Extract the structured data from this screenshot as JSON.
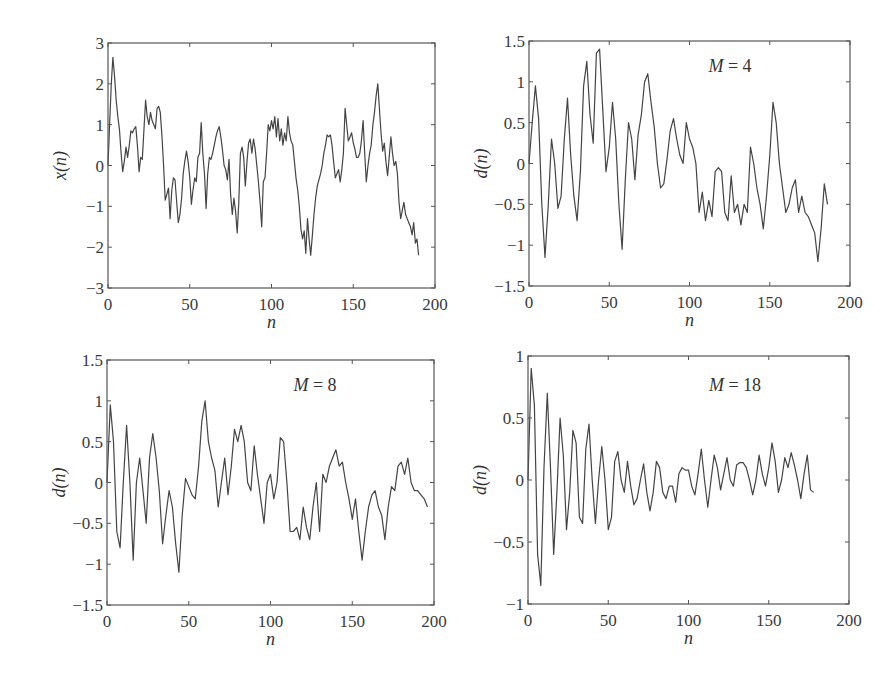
{
  "chart_data": [
    {
      "type": "line",
      "panel": "top-left",
      "title": "",
      "annotation": "",
      "xlabel": "n",
      "ylabel": "x(n)",
      "xlim": [
        0,
        200
      ],
      "ylim": [
        -3,
        3
      ],
      "xticks": [
        "0",
        "50",
        "100",
        "150",
        "200"
      ],
      "yticks": [
        "3",
        "2",
        "1",
        "0",
        "−1",
        "−2",
        "−3"
      ],
      "grid": false,
      "series": [
        {
          "name": "x(n)",
          "x": [
            0,
            1,
            2,
            3,
            4,
            5,
            6,
            7,
            8,
            9,
            10,
            11,
            12,
            13,
            14,
            15,
            16,
            17,
            18,
            19,
            20,
            21,
            22,
            23,
            24,
            25,
            26,
            27,
            28,
            29,
            30,
            31,
            32,
            33,
            34,
            35,
            36,
            37,
            38,
            39,
            40,
            41,
            42,
            43,
            44,
            45,
            46,
            47,
            48,
            49,
            50,
            51,
            52,
            53,
            54,
            55,
            56,
            57,
            58,
            59,
            60,
            61,
            62,
            63,
            64,
            65,
            66,
            67,
            68,
            69,
            70,
            71,
            72,
            73,
            74,
            75,
            76,
            77,
            78,
            79,
            80,
            81,
            82,
            83,
            84,
            85,
            86,
            87,
            88,
            89,
            90,
            91,
            92,
            93,
            94,
            95,
            96,
            97,
            98,
            99,
            100,
            101,
            102,
            103,
            104,
            105,
            106,
            107,
            108,
            109,
            110,
            111,
            112,
            113,
            114,
            115,
            116,
            117,
            118,
            119,
            120,
            121,
            122,
            123,
            124,
            125,
            126,
            127,
            128,
            129,
            130,
            131,
            132,
            133,
            134,
            135,
            136,
            137,
            138,
            139,
            140,
            141,
            142,
            143,
            144,
            145,
            146,
            147,
            148,
            149,
            150,
            151,
            152,
            153,
            154,
            155,
            156,
            157,
            158,
            159,
            160,
            161,
            162,
            163,
            164,
            165,
            166,
            167,
            168,
            169,
            170,
            171,
            172,
            173,
            174,
            175,
            176,
            177,
            178,
            179,
            180,
            181,
            182,
            183,
            184,
            185,
            186,
            187,
            188,
            189,
            190,
            191,
            192,
            193,
            194,
            195,
            196,
            197,
            198,
            199,
            200
          ],
          "values": [
            0,
            1.0,
            2.0,
            2.65,
            2.2,
            1.6,
            1.2,
            0.9,
            0.3,
            -0.15,
            0.1,
            0.45,
            0.2,
            0.5,
            0.85,
            0.8,
            0.9,
            0.95,
            0.5,
            -0.15,
            0.2,
            0.15,
            0.9,
            1.6,
            1.2,
            1.0,
            1.3,
            1.1,
            1.0,
            0.9,
            1.4,
            1.45,
            1.3,
            0.7,
            0.0,
            -0.85,
            -0.7,
            -0.55,
            -1.3,
            -0.6,
            -0.3,
            -0.35,
            -0.9,
            -1.4,
            -1.2,
            -0.8,
            -0.2,
            0.1,
            0.35,
            0.1,
            -0.3,
            -0.95,
            -0.6,
            -0.3,
            -0.4,
            0.2,
            0.3,
            1.05,
            0.3,
            -0.2,
            -1.05,
            -0.2,
            0.2,
            0.15,
            0.3,
            0.5,
            0.7,
            0.85,
            0.95,
            0.7,
            0.4,
            0.0,
            -0.1,
            -0.35,
            0.15,
            -0.7,
            -1.2,
            -0.8,
            -1.1,
            -1.65,
            -0.9,
            0.3,
            0.45,
            0.2,
            -0.5,
            0.1,
            0.55,
            0.65,
            0.3,
            0.65,
            0.4,
            0.0,
            -0.4,
            -0.9,
            -1.5,
            -0.4,
            -0.3,
            0.3,
            1.0,
            0.85,
            1.1,
            0.9,
            1.2,
            0.7,
            1.15,
            0.6,
            0.9,
            0.5,
            0.8,
            0.6,
            1.2,
            0.8,
            0.6,
            0.5,
            0.1,
            -0.3,
            -0.6,
            -1.0,
            -1.55,
            -1.8,
            -1.6,
            -2.15,
            -1.3,
            -1.8,
            -2.2,
            -1.7,
            -1.2,
            -0.8,
            -0.5,
            -0.35,
            -0.2,
            0.0,
            0.3,
            0.5,
            0.75,
            0.7,
            0.75,
            0.5,
            0.1,
            -0.3,
            -0.2,
            -0.1,
            -0.4,
            -0.1,
            0.3,
            1.4,
            1.0,
            0.6,
            0.7,
            0.8,
            0.55,
            0.4,
            0.2,
            0.2,
            0.3,
            0.6,
            1.1,
            0.3,
            -0.4,
            0.0,
            0.3,
            0.5,
            1.0,
            1.3,
            1.7,
            2.0,
            1.4,
            0.8,
            0.35,
            0.55,
            0.1,
            -0.25,
            0.2,
            0.7,
            0.3,
            0.0,
            0.1,
            -0.2,
            -0.9,
            -1.3,
            -1.1,
            -0.9,
            -1.2,
            -1.3,
            -1.4,
            -1.5,
            -1.7,
            -1.4,
            -1.9,
            -1.8,
            -2.2
          ]
        }
      ]
    },
    {
      "type": "line",
      "panel": "top-right",
      "annotation": "M = 4",
      "xlabel": "n",
      "ylabel": "d(n)",
      "xlim": [
        0,
        200
      ],
      "ylim": [
        -1.5,
        1.5
      ],
      "xticks": [
        "0",
        "50",
        "100",
        "150",
        "200"
      ],
      "yticks": [
        "1.5",
        "1",
        "0.5",
        "0",
        "−0.5",
        "−1",
        "−1.5"
      ],
      "grid": false,
      "series": [
        {
          "name": "d(n), M=4",
          "x": [
            0,
            2,
            4,
            6,
            8,
            10,
            12,
            14,
            16,
            18,
            20,
            22,
            24,
            26,
            28,
            30,
            32,
            34,
            36,
            38,
            40,
            42,
            44,
            46,
            48,
            50,
            52,
            54,
            56,
            58,
            60,
            62,
            64,
            66,
            68,
            70,
            72,
            74,
            76,
            78,
            80,
            82,
            84,
            86,
            88,
            90,
            92,
            94,
            96,
            98,
            100,
            102,
            104,
            106,
            108,
            110,
            112,
            114,
            116,
            118,
            120,
            122,
            124,
            126,
            128,
            130,
            132,
            134,
            136,
            138,
            140,
            142,
            144,
            146,
            148,
            150,
            152,
            154,
            156,
            158,
            160,
            162,
            164,
            166,
            168,
            170,
            172,
            174,
            176,
            178,
            180,
            182,
            184,
            186,
            188,
            190,
            192,
            194,
            196,
            198,
            200
          ],
          "values": [
            0,
            0.5,
            0.95,
            0.55,
            -0.5,
            -1.15,
            -0.5,
            0.3,
            0.0,
            -0.55,
            -0.4,
            0.3,
            0.8,
            0.1,
            -0.4,
            -0.7,
            -0.1,
            0.95,
            1.25,
            0.6,
            0.25,
            1.35,
            1.4,
            0.65,
            -0.1,
            0.2,
            0.75,
            0.3,
            -0.5,
            -1.05,
            -0.2,
            0.5,
            0.3,
            -0.2,
            0.35,
            0.6,
            1.0,
            1.1,
            0.75,
            0.45,
            0.0,
            -0.3,
            -0.25,
            0.05,
            0.4,
            0.55,
            0.3,
            0.1,
            0.0,
            0.5,
            0.3,
            0.2,
            0.0,
            -0.6,
            -0.35,
            -0.7,
            -0.45,
            -0.65,
            -0.1,
            -0.05,
            -0.1,
            -0.6,
            -0.7,
            -0.15,
            -0.6,
            -0.5,
            -0.75,
            -0.5,
            -0.6,
            0.2,
            0.0,
            -0.3,
            -0.5,
            -0.8,
            -0.4,
            0.1,
            0.75,
            0.5,
            0.0,
            -0.3,
            -0.6,
            -0.5,
            -0.3,
            -0.2,
            -0.6,
            -0.4,
            -0.6,
            -0.65,
            -0.75,
            -0.85,
            -1.2,
            -0.8,
            -0.25,
            -0.5
          ]
        }
      ]
    },
    {
      "type": "line",
      "panel": "bottom-left",
      "annotation": "M = 8",
      "xlabel": "n",
      "ylabel": "d(n)",
      "xlim": [
        0,
        200
      ],
      "ylim": [
        -1.5,
        1.5
      ],
      "xticks": [
        "0",
        "50",
        "100",
        "150",
        "200"
      ],
      "yticks": [
        "1.5",
        "1",
        "0.5",
        "0",
        "−0.5",
        "−1",
        "−1.5"
      ],
      "grid": false,
      "series": [
        {
          "name": "d(n), M=8",
          "x": [
            0,
            2,
            4,
            6,
            8,
            10,
            12,
            14,
            16,
            18,
            20,
            22,
            24,
            26,
            28,
            30,
            32,
            34,
            36,
            38,
            40,
            42,
            44,
            46,
            48,
            50,
            52,
            54,
            56,
            58,
            60,
            62,
            64,
            66,
            68,
            70,
            72,
            74,
            76,
            78,
            80,
            82,
            84,
            86,
            88,
            90,
            92,
            94,
            96,
            98,
            100,
            102,
            104,
            106,
            108,
            110,
            112,
            114,
            116,
            118,
            120,
            122,
            124,
            126,
            128,
            130,
            132,
            134,
            136,
            138,
            140,
            142,
            144,
            146,
            148,
            150,
            152,
            154,
            156,
            158,
            160,
            162,
            164,
            166,
            168,
            170,
            172,
            174,
            176,
            178,
            180,
            182,
            184,
            186,
            188,
            190,
            192,
            194,
            196,
            198,
            200
          ],
          "values": [
            0,
            0.95,
            0.5,
            -0.6,
            -0.8,
            0.0,
            0.7,
            0.0,
            -0.95,
            0.0,
            0.3,
            -0.1,
            -0.5,
            0.3,
            0.6,
            0.3,
            -0.1,
            -0.75,
            -0.4,
            -0.1,
            -0.3,
            -0.75,
            -1.1,
            -0.4,
            0.05,
            -0.05,
            -0.15,
            -0.2,
            0.2,
            0.75,
            1.0,
            0.5,
            0.3,
            0.15,
            -0.3,
            0.0,
            0.3,
            -0.15,
            0.2,
            0.65,
            0.5,
            0.7,
            0.5,
            0.0,
            -0.1,
            0.45,
            0.1,
            -0.2,
            -0.5,
            0.0,
            0.1,
            -0.2,
            0.0,
            0.55,
            0.5,
            0.0,
            -0.6,
            -0.6,
            -0.55,
            -0.7,
            -0.3,
            -0.55,
            -0.7,
            -0.3,
            0.0,
            -0.6,
            0.1,
            0.0,
            0.2,
            0.3,
            0.4,
            0.2,
            0.25,
            0.0,
            -0.2,
            -0.45,
            -0.2,
            -0.6,
            -0.95,
            -0.6,
            -0.3,
            -0.15,
            -0.1,
            -0.3,
            -0.4,
            -0.7,
            -0.3,
            -0.05,
            -0.1,
            0.2,
            0.25,
            0.1,
            0.3,
            0.0,
            -0.1,
            -0.1,
            -0.15,
            -0.2,
            -0.3
          ]
        }
      ]
    },
    {
      "type": "line",
      "panel": "bottom-right",
      "annotation": "M = 18",
      "xlabel": "n",
      "ylabel": "d(n)",
      "xlim": [
        0,
        200
      ],
      "ylim": [
        -1,
        1
      ],
      "xticks": [
        "0",
        "50",
        "100",
        "150",
        "200"
      ],
      "yticks": [
        "1",
        "0.5",
        "0",
        "−0.5",
        "−1"
      ],
      "grid": false,
      "series": [
        {
          "name": "d(n), M=18",
          "x": [
            0,
            2,
            4,
            6,
            8,
            10,
            12,
            14,
            16,
            18,
            20,
            22,
            24,
            26,
            28,
            30,
            32,
            34,
            36,
            38,
            40,
            42,
            44,
            46,
            48,
            50,
            52,
            54,
            56,
            58,
            60,
            62,
            64,
            66,
            68,
            70,
            72,
            74,
            76,
            78,
            80,
            82,
            84,
            86,
            88,
            90,
            92,
            94,
            96,
            98,
            100,
            102,
            104,
            106,
            108,
            110,
            112,
            114,
            116,
            118,
            120,
            122,
            124,
            126,
            128,
            130,
            132,
            134,
            136,
            138,
            140,
            142,
            144,
            146,
            148,
            150,
            152,
            154,
            156,
            158,
            160,
            162,
            164,
            166,
            168,
            170,
            172,
            174,
            176,
            178,
            180,
            182,
            184,
            186,
            188,
            190,
            192,
            194,
            196,
            198,
            200
          ],
          "values": [
            0,
            0.9,
            0.6,
            -0.6,
            -0.85,
            0.1,
            0.7,
            0.1,
            -0.6,
            -0.1,
            0.5,
            0.2,
            -0.4,
            -0.1,
            0.4,
            0.3,
            -0.3,
            -0.35,
            0.25,
            0.45,
            0.0,
            -0.35,
            0.0,
            0.27,
            0.0,
            -0.4,
            -0.3,
            0.15,
            0.23,
            0.0,
            -0.1,
            0.15,
            -0.05,
            -0.2,
            -0.15,
            0.0,
            0.13,
            -0.1,
            -0.25,
            -0.1,
            0.15,
            0.1,
            -0.1,
            -0.15,
            -0.05,
            -0.05,
            -0.18,
            0.05,
            0.1,
            0.08,
            0.08,
            -0.05,
            -0.12,
            0.05,
            0.25,
            0.0,
            -0.22,
            0.0,
            0.2,
            0.1,
            -0.08,
            0.05,
            0.18,
            0.0,
            -0.05,
            0.12,
            0.14,
            0.14,
            0.1,
            0.0,
            -0.12,
            0.0,
            0.2,
            0.05,
            -0.05,
            0.1,
            0.3,
            0.15,
            -0.1,
            0.0,
            0.18,
            0.1,
            0.22,
            0.12,
            0.0,
            -0.15,
            0.05,
            0.2,
            -0.08,
            -0.1
          ]
        }
      ]
    }
  ]
}
